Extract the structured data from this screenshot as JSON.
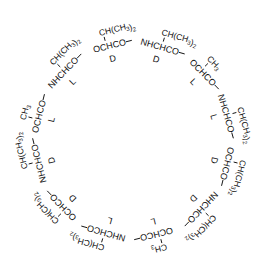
{
  "diagram": {
    "type": "cyclic-depsipeptide-ring",
    "center": [
      133,
      140
    ],
    "linker": "—",
    "units": [
      {
        "backbone": "OCHCO",
        "side_chain": "CH(CH3)2",
        "stereo": "D",
        "angle": -14
      },
      {
        "backbone": "NHCHCO",
        "side_chain": "CH(CH3)2",
        "stereo": "D",
        "angle": 16
      },
      {
        "backbone": "OCHCO",
        "side_chain": "CH3",
        "stereo": "L",
        "angle": 46
      },
      {
        "backbone": "NHCHCO",
        "side_chain": "CH(CH3)2",
        "stereo": "L",
        "angle": 74
      },
      {
        "backbone": "OCHCO",
        "side_chain": "CH(CH3)2",
        "stereo": "D",
        "angle": 104
      },
      {
        "backbone": "NHCHCO",
        "side_chain": "CH(CH3)2",
        "stereo": "D",
        "angle": 134
      },
      {
        "backbone": "OCHCO",
        "side_chain": "CH3",
        "stereo": "L",
        "angle": 166
      },
      {
        "backbone": "NHCHCO",
        "side_chain": "CH(CH3)2",
        "stereo": "L",
        "angle": 196
      },
      {
        "backbone": "OCHCO",
        "side_chain": "CH(CH3)2",
        "stereo": "D",
        "angle": 226
      },
      {
        "backbone": "NHCHCO",
        "side_chain": "CH(CH3)2",
        "stereo": "D",
        "angle": 256
      },
      {
        "backbone": "OCHCO",
        "side_chain": "CH3",
        "stereo": "L",
        "angle": 284
      },
      {
        "backbone": "NHCHCO",
        "side_chain": "CH(CH3)2",
        "stereo": "L",
        "angle": 314
      }
    ]
  }
}
